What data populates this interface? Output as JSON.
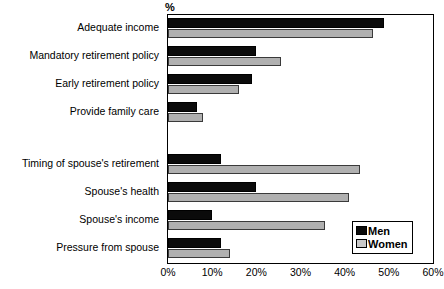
{
  "chart_data": {
    "type": "bar",
    "orientation": "horizontal",
    "title": "",
    "xlabel": "%",
    "ylabel": "",
    "xlim": [
      0,
      60
    ],
    "xticks": [
      "0%",
      "10%",
      "20%",
      "30%",
      "40%",
      "50%",
      "60%"
    ],
    "xtick_values": [
      0,
      10,
      20,
      30,
      40,
      50,
      60
    ],
    "grid": false,
    "legend_position": "bottom-right",
    "categories": [
      "Adequate income",
      "Mandatory retirement policy",
      "Early retirement policy",
      "Provide family care",
      "Timing of spouse's retirement",
      "Spouse's health",
      "Spouse's income",
      "Pressure from spouse"
    ],
    "group_break_after_index": 3,
    "series": [
      {
        "name": "Men",
        "color": "#0b0b0b",
        "values": [
          49,
          20,
          19,
          6.5,
          12,
          20,
          10,
          12
        ]
      },
      {
        "name": "Women",
        "color": "#b0b0b0",
        "values": [
          46.5,
          25.5,
          16,
          8,
          43.5,
          41,
          35.5,
          14
        ]
      }
    ]
  },
  "legend": {
    "items": [
      {
        "label": "Men",
        "swatch": "men"
      },
      {
        "label": "Women",
        "swatch": "women"
      }
    ]
  },
  "axis": {
    "unit_label": "%"
  }
}
